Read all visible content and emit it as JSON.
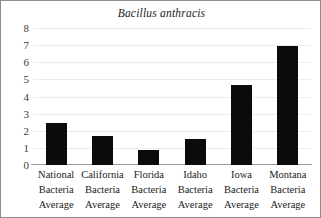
{
  "chart_data": {
    "type": "bar",
    "title": "Bacillus anthracis",
    "xlabel": "",
    "ylabel": "",
    "ylim": [
      0,
      8
    ],
    "yticks": [
      0,
      1,
      2,
      3,
      4,
      5,
      6,
      7,
      8
    ],
    "grid": true,
    "legend": "none",
    "bar_color": "#0b0b0b",
    "categories": [
      "National Bacteria Average",
      "California Bacteria Average",
      "Florida Bacteria Average",
      "Idaho Bacteria Average",
      "Iowa Bacteria Average",
      "Montana Bacteria Average"
    ],
    "category_lines": [
      [
        "National",
        "Bacteria",
        "Average"
      ],
      [
        "California",
        "Bacteria",
        "Average"
      ],
      [
        "Florida",
        "Bacteria",
        "Average"
      ],
      [
        "Idaho",
        "Bacteria",
        "Average"
      ],
      [
        "Iowa",
        "Bacteria",
        "Average"
      ],
      [
        "Montana",
        "Bacteria",
        "Average"
      ]
    ],
    "values": [
      2.45,
      1.7,
      0.85,
      1.5,
      4.65,
      6.95
    ]
  }
}
